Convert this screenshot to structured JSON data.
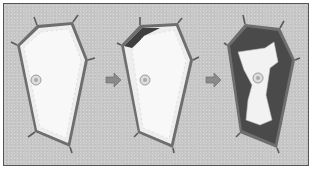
{
  "figure": {
    "stages": [
      {
        "name": "turgid cell",
        "description": "cytoplasm pressed against cell wall, central vacuole full"
      },
      {
        "name": "incipient plasmolysis",
        "description": "membrane begins pulling away at top-left corner"
      },
      {
        "name": "plasmolysed cell",
        "description": "protoplast shrunk, dark gaps between wall and membrane"
      }
    ],
    "arrows": 2,
    "colors": {
      "background": "#c8c8c8",
      "cell_wall": "#6e6e6e",
      "cytoplasm": "#f2f2f2",
      "gap_dark": "#4a4a4a",
      "arrow": "#8a8a8a"
    }
  }
}
